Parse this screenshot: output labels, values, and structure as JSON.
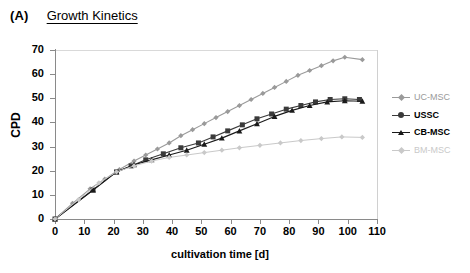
{
  "panel": {
    "letter": "(A)",
    "title": "Growth Kinetics"
  },
  "colors": {
    "uc_msc": "#9a9a9a",
    "ussc": "#3a3a3a",
    "cb_msc": "#1a1a1a",
    "bm_msc": "#c9c9c9",
    "axis": "#8a8a8a",
    "frame": "#d9d9d9"
  },
  "chart_data": {
    "type": "line",
    "title": "Growth Kinetics",
    "xlabel": "cultivation time [d]",
    "ylabel": "CPD",
    "xlim": [
      0,
      110
    ],
    "ylim": [
      0,
      70
    ],
    "xticks": [
      0,
      10,
      20,
      30,
      40,
      50,
      60,
      70,
      80,
      90,
      100,
      110
    ],
    "yticks": [
      0,
      10,
      20,
      30,
      40,
      50,
      60,
      70
    ],
    "grid": false,
    "legend_position": "right",
    "series": [
      {
        "name": "UC-MSC",
        "color": "#9a9a9a",
        "marker": "diamond",
        "x": [
          0,
          6,
          12,
          17,
          22,
          27,
          31,
          35,
          39,
          43,
          47,
          51,
          55,
          59,
          63,
          67,
          71,
          75,
          79,
          83,
          87,
          91,
          95,
          99,
          105
        ],
        "y": [
          0,
          6.5,
          12.5,
          16.5,
          20.5,
          24.0,
          26.5,
          29.0,
          31.5,
          34.5,
          37.0,
          39.5,
          42.0,
          44.5,
          47.0,
          49.5,
          52.0,
          54.5,
          57.0,
          59.5,
          61.5,
          63.5,
          65.5,
          67.0,
          66.0
        ]
      },
      {
        "name": "USSC",
        "color": "#3a3a3a",
        "marker": "square",
        "x": [
          0,
          13,
          21,
          26,
          31,
          37,
          43,
          49,
          54,
          59,
          64,
          69,
          74,
          79,
          84,
          89,
          94,
          99,
          104
        ],
        "y": [
          0,
          12.0,
          19.5,
          22.0,
          24.5,
          27.0,
          29.5,
          31.5,
          34.0,
          36.5,
          39.0,
          41.5,
          43.5,
          45.5,
          47.0,
          48.5,
          49.5,
          49.8,
          49.5
        ]
      },
      {
        "name": "CB-MSC",
        "color": "#1a1a1a",
        "marker": "triangle",
        "x": [
          0,
          13,
          21,
          27,
          33,
          39,
          45,
          51,
          57,
          63,
          69,
          75,
          81,
          87,
          93,
          99,
          105
        ],
        "y": [
          0,
          12.0,
          19.5,
          22.5,
          24.5,
          26.5,
          28.5,
          31.0,
          33.5,
          36.5,
          39.5,
          42.5,
          45.0,
          47.0,
          48.5,
          49.0,
          48.8
        ]
      },
      {
        "name": "BM-MSC",
        "color": "#c9c9c9",
        "marker": "diamond",
        "x": [
          0,
          8,
          15,
          21,
          27,
          33,
          39,
          45,
          51,
          57,
          63,
          70,
          77,
          84,
          91,
          98,
          105
        ],
        "y": [
          0,
          8.0,
          15.0,
          19.5,
          22.0,
          24.0,
          25.5,
          26.5,
          27.5,
          28.5,
          29.5,
          30.5,
          31.5,
          32.5,
          33.3,
          34.0,
          33.8
        ]
      }
    ]
  },
  "legend": {
    "items": [
      {
        "label": "UC-MSC",
        "color": "#9a9a9a",
        "marker": "diamond",
        "bold": false
      },
      {
        "label": "USSC",
        "color": "#3a3a3a",
        "marker": "circle",
        "bold": true
      },
      {
        "label": "CB-MSC",
        "color": "#1a1a1a",
        "marker": "triangle",
        "bold": true
      },
      {
        "label": "BM-MSC",
        "color": "#c9c9c9",
        "marker": "diamond",
        "bold": false
      }
    ]
  }
}
